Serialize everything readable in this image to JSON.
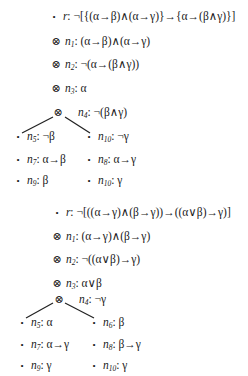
{
  "trees": [
    {
      "nodes": [
        {
          "id": "r",
          "mark": "•",
          "name": "r",
          "sub": "",
          "formula": "¬[{(α→β)∧(α→γ)}→{α→(β∧γ)}]"
        },
        {
          "id": "n1",
          "mark": "⊗",
          "name": "n",
          "sub": "1",
          "formula": "(α→β)∧(α→γ)"
        },
        {
          "id": "n2",
          "mark": "⊗",
          "name": "n",
          "sub": "2",
          "formula": "¬(α→(β∧γ))"
        },
        {
          "id": "n3",
          "mark": "⊗",
          "name": "n",
          "sub": "3",
          "formula": "α"
        },
        {
          "id": "n4",
          "mark": "⊗",
          "name": "n",
          "sub": "4",
          "formula": "¬(β∧γ)"
        },
        {
          "id": "n5",
          "mark": "•",
          "name": "n",
          "sub": "5",
          "formula": "¬β"
        },
        {
          "id": "n6",
          "mark": "•",
          "name": "n",
          "sub": "10",
          "formula": "¬γ"
        },
        {
          "id": "n7",
          "mark": "•",
          "name": "n",
          "sub": "7",
          "formula": "α→β"
        },
        {
          "id": "n8",
          "mark": "•",
          "name": "n",
          "sub": "8",
          "formula": "α→γ"
        },
        {
          "id": "n9",
          "mark": "•",
          "name": "n",
          "sub": "9",
          "formula": "β"
        },
        {
          "id": "n10",
          "mark": "•",
          "name": "n",
          "sub": "10",
          "formula": "γ"
        }
      ]
    },
    {
      "nodes": [
        {
          "id": "r",
          "mark": "•",
          "name": "r",
          "sub": "",
          "formula": "¬[((α→γ)∧(β→γ))→((α∨β)→γ)]"
        },
        {
          "id": "n1",
          "mark": "⊗",
          "name": "n",
          "sub": "1",
          "formula": "(α→γ)∧(β→γ)"
        },
        {
          "id": "n2",
          "mark": "⊗",
          "name": "n",
          "sub": "2",
          "formula": "¬((α∨β)→γ)"
        },
        {
          "id": "n3",
          "mark": "⊗",
          "name": "n",
          "sub": "3",
          "formula": "α∨β"
        },
        {
          "id": "n4",
          "mark": "⊗",
          "name": "n",
          "sub": "4",
          "formula": "¬γ"
        },
        {
          "id": "n5",
          "mark": "•",
          "name": "n",
          "sub": "5",
          "formula": "α"
        },
        {
          "id": "n6",
          "mark": "•",
          "name": "n",
          "sub": "6",
          "formula": "β"
        },
        {
          "id": "n7",
          "mark": "•",
          "name": "n",
          "sub": "7",
          "formula": "α→γ"
        },
        {
          "id": "n8",
          "mark": "•",
          "name": "n",
          "sub": "8",
          "formula": "β→γ"
        },
        {
          "id": "n9",
          "mark": "•",
          "name": "n",
          "sub": "9",
          "formula": "γ"
        },
        {
          "id": "n10",
          "mark": "•",
          "name": "n",
          "sub": "10",
          "formula": "γ"
        }
      ]
    }
  ]
}
